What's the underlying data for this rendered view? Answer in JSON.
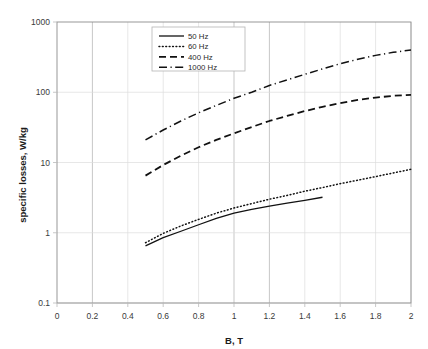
{
  "chart_data": {
    "type": "line",
    "title": "",
    "xlabel": "B, T",
    "ylabel": "specific losses, W/kg",
    "xlim": [
      0,
      2
    ],
    "ylim": [
      0.1,
      1000
    ],
    "yscale": "log",
    "xscale": "linear",
    "grid": true,
    "legend_position": "top-center",
    "xticks": [
      "0",
      "0.2",
      "0.4",
      "0.6",
      "0.8",
      "1",
      "1.2",
      "1.4",
      "1.6",
      "1.8",
      "2"
    ],
    "xtick_values": [
      0,
      0.2,
      0.4,
      0.6,
      0.8,
      1.0,
      1.2,
      1.4,
      1.6,
      1.8,
      2.0
    ],
    "yticks": [
      "1000",
      "100",
      "10",
      "1",
      "0.1"
    ],
    "ytick_values": [
      1000,
      100,
      10,
      1,
      0.1
    ],
    "series": [
      {
        "name": "50 Hz",
        "style": "solid",
        "color": "#111111",
        "x": [
          0.5,
          0.6,
          0.7,
          0.8,
          0.9,
          1.0,
          1.1,
          1.2,
          1.3,
          1.4,
          1.5
        ],
        "values": [
          0.65,
          0.85,
          1.05,
          1.3,
          1.6,
          1.9,
          2.15,
          2.4,
          2.65,
          2.9,
          3.2
        ]
      },
      {
        "name": "60 Hz",
        "style": "dotted",
        "color": "#111111",
        "x": [
          0.5,
          0.6,
          0.7,
          0.8,
          0.9,
          1.0,
          1.1,
          1.2,
          1.3,
          1.4,
          1.5,
          1.6,
          1.7,
          1.8,
          1.9,
          2.0
        ],
        "values": [
          0.72,
          0.98,
          1.25,
          1.55,
          1.9,
          2.25,
          2.6,
          3.0,
          3.4,
          3.9,
          4.4,
          5.0,
          5.6,
          6.3,
          7.1,
          8.0
        ]
      },
      {
        "name": "400 Hz",
        "style": "dashed",
        "color": "#111111",
        "x": [
          0.5,
          0.6,
          0.7,
          0.8,
          0.9,
          1.0,
          1.1,
          1.2,
          1.3,
          1.4,
          1.5,
          1.6,
          1.7,
          1.8,
          1.9,
          2.0
        ],
        "values": [
          6.5,
          9.2,
          12.5,
          16.5,
          21.0,
          26.0,
          32.0,
          39.0,
          46.0,
          54.0,
          62.0,
          70.0,
          78.0,
          84.0,
          89.0,
          92.0
        ]
      },
      {
        "name": "1000 Hz",
        "style": "dashdot",
        "color": "#111111",
        "x": [
          0.5,
          0.6,
          0.7,
          0.8,
          0.9,
          1.0,
          1.1,
          1.2,
          1.3,
          1.4,
          1.5,
          1.6,
          1.7,
          1.8,
          1.9,
          2.0
        ],
        "values": [
          21.0,
          29.0,
          39.0,
          51.0,
          65.0,
          82.0,
          100.0,
          125.0,
          150.0,
          180.0,
          215.0,
          255.0,
          295.0,
          335.0,
          370.0,
          400.0
        ]
      }
    ]
  },
  "legend": {
    "entries": [
      {
        "label": "50 Hz",
        "style": "solid"
      },
      {
        "label": "60 Hz",
        "style": "dotted"
      },
      {
        "label": "400 Hz",
        "style": "dashed"
      },
      {
        "label": "1000 Hz",
        "style": "dashdot"
      }
    ]
  }
}
